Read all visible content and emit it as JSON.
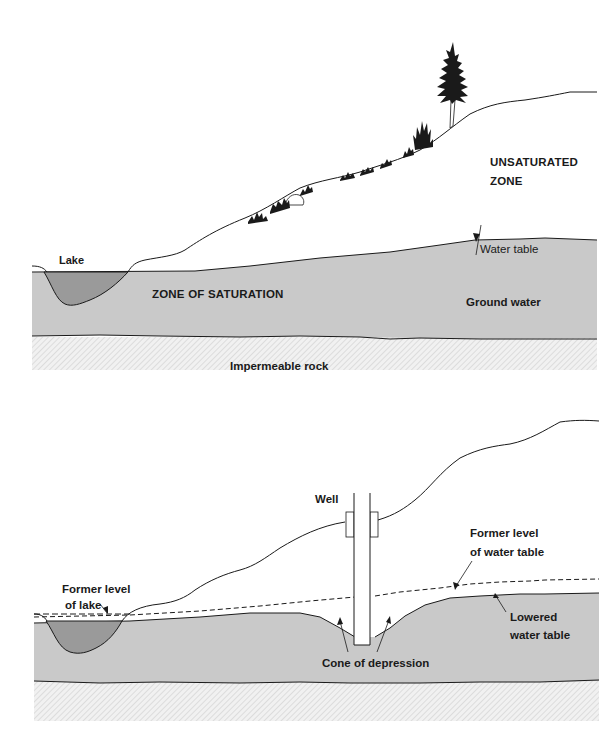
{
  "colors": {
    "saturated": "#c9c9c9",
    "lake": "#9a9a9a",
    "rock_bg": "#f1f1f1",
    "rock_hatch": "#d0d0d0",
    "line": "#1a1a1a",
    "background": "#ffffff"
  },
  "top_panel": {
    "labels": {
      "unsaturated_line1": "UNSATURATED",
      "unsaturated_line2": "ZONE",
      "water_table": "Water table",
      "lake": "Lake",
      "zone_of_saturation": "ZONE OF SATURATION",
      "ground_water": "Ground water",
      "impermeable_rock": "Impermeable rock"
    }
  },
  "bottom_panel": {
    "labels": {
      "well": "Well",
      "former_level_lake_line1": "Former level",
      "former_level_lake_line2": "of lake",
      "former_level_wt_line1": "Former level",
      "former_level_wt_line2": "of water table",
      "lowered_wt_line1": "Lowered",
      "lowered_wt_line2": "water table",
      "cone_of_depression": "Cone of depression"
    }
  }
}
